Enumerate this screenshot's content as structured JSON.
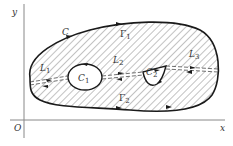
{
  "diagram": {
    "axes": {
      "x_label": "x",
      "y_label": "y",
      "origin_label": "O"
    },
    "outer_curve": {
      "label": "C"
    },
    "holes": [
      {
        "label": "C",
        "subscript": "1"
      },
      {
        "label": "C",
        "subscript": "2"
      }
    ],
    "cuts": [
      {
        "label": "L",
        "subscript": "1"
      },
      {
        "label": "L",
        "subscript": "2"
      },
      {
        "label": "L",
        "subscript": "3"
      }
    ],
    "arcs": [
      {
        "label": "Γ",
        "subscript": "1"
      },
      {
        "label": "Γ",
        "subscript": "2"
      }
    ],
    "colors": {
      "stroke": "#1a1a1a",
      "hatch": "#555555",
      "axis": "#777777"
    }
  }
}
